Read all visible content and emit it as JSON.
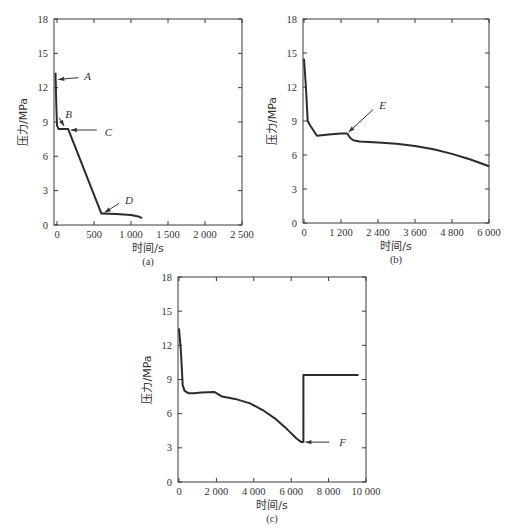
{
  "chart_data": [
    {
      "id": "a",
      "type": "line",
      "caption": "(a)",
      "xlabel": "时间/s",
      "ylabel": "压力/MPa",
      "xlim": [
        0,
        2500
      ],
      "ylim": [
        0,
        18
      ],
      "xticks": [
        0,
        500,
        1000,
        1500,
        2000,
        2500
      ],
      "xtick_labels": [
        "0",
        "500",
        "1 000",
        "1 500",
        "2 000",
        "2 500"
      ],
      "yticks": [
        0,
        3,
        6,
        9,
        12,
        15,
        18
      ],
      "series": [
        {
          "name": "pressure",
          "x": [
            -20,
            -10,
            0,
            20,
            40,
            100,
            150,
            600,
            620,
            700,
            800,
            900,
            1000,
            1100,
            1150
          ],
          "y": [
            13.3,
            10.5,
            8.7,
            8.4,
            8.4,
            8.4,
            8.4,
            1.0,
            1.0,
            0.98,
            0.95,
            0.92,
            0.88,
            0.75,
            0.6
          ]
        }
      ],
      "annotations": [
        {
          "label": "A",
          "x": -10,
          "y": 12.7
        },
        {
          "label": "B",
          "x": 110,
          "y": 8.5
        },
        {
          "label": "C",
          "x": 160,
          "y": 8.3
        },
        {
          "label": "D",
          "x": 620,
          "y": 1.0
        }
      ]
    },
    {
      "id": "b",
      "type": "line",
      "caption": "(b)",
      "xlabel": "时间/s",
      "ylabel": "压力/MPa",
      "xlim": [
        0,
        6000
      ],
      "ylim": [
        0,
        18
      ],
      "xticks": [
        0,
        1200,
        2400,
        3600,
        4800,
        6000
      ],
      "xtick_labels": [
        "0",
        "1 200",
        "2 400",
        "3 600",
        "4 800",
        "6 000"
      ],
      "yticks": [
        0,
        3,
        6,
        9,
        12,
        15,
        18
      ],
      "series": [
        {
          "name": "pressure",
          "x": [
            0,
            60,
            120,
            200,
            420,
            800,
            1200,
            1400,
            1500,
            1600,
            1800,
            2400,
            3000,
            3600,
            4200,
            4800,
            5400,
            6000
          ],
          "y": [
            14.5,
            12.0,
            9.0,
            8.6,
            7.7,
            7.8,
            7.9,
            7.9,
            7.5,
            7.3,
            7.2,
            7.1,
            7.0,
            6.8,
            6.5,
            6.1,
            5.6,
            5.0
          ]
        }
      ],
      "annotations": [
        {
          "label": "E",
          "x": 1400,
          "y": 7.9
        }
      ]
    },
    {
      "id": "c",
      "type": "line",
      "caption": "(c)",
      "xlabel": "时间/s",
      "ylabel": "压力/MPa",
      "xlim": [
        0,
        10000
      ],
      "ylim": [
        0,
        18
      ],
      "xticks": [
        0,
        2000,
        4000,
        6000,
        8000,
        10000
      ],
      "xtick_labels": [
        "0",
        "2 000",
        "4 000",
        "6 000",
        "8 000",
        "10 000"
      ],
      "yticks": [
        0,
        3,
        6,
        9,
        12,
        15,
        18
      ],
      "series": [
        {
          "name": "pressure",
          "x": [
            0,
            100,
            200,
            300,
            500,
            800,
            1200,
            1900,
            2000,
            2300,
            3000,
            3800,
            4500,
            5200,
            5800,
            6300,
            6550,
            6650,
            6650,
            9600
          ],
          "y": [
            13.5,
            11.5,
            8.5,
            8.0,
            7.8,
            7.8,
            7.85,
            7.9,
            7.8,
            7.5,
            7.3,
            6.9,
            6.3,
            5.5,
            4.6,
            3.8,
            3.5,
            3.5,
            9.4,
            9.4
          ]
        }
      ],
      "annotations": [
        {
          "label": "F",
          "x": 6650,
          "y": 3.5
        }
      ]
    }
  ]
}
